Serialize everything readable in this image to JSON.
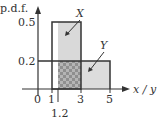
{
  "diagram": {
    "y_axis_label": "p.d.f.",
    "x_axis_label": "x / y",
    "y_ticks": [
      "0.5",
      "0.2"
    ],
    "x_ticks": [
      "0",
      "1",
      "3",
      "5"
    ],
    "x_extra_tick": "1.2",
    "series": [
      {
        "name": "X",
        "x_range": [
          1,
          3
        ],
        "height": 0.5
      },
      {
        "name": "Y",
        "x_range": [
          1.2,
          5
        ],
        "height": 0.2
      }
    ],
    "colors": {
      "shade": "#d9d9d9",
      "overlap": "#a8a8a8",
      "line": "#333333"
    }
  }
}
